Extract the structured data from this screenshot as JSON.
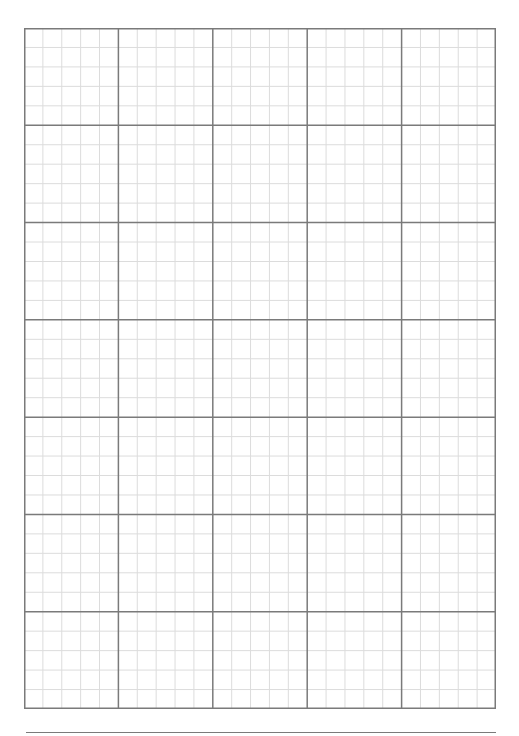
{
  "page": {
    "type": "graph-paper",
    "background": "#ffffff"
  },
  "grid": {
    "left": 24,
    "top": 28,
    "width": 472,
    "height": 681,
    "major_columns": 5,
    "major_rows": 7,
    "minor_subdivisions": 5,
    "major_color": "#7a7a7a",
    "minor_color": "#dcdcdc",
    "major_width": 1.5,
    "minor_width": 1
  },
  "footer_line": {
    "left": 26,
    "top": 732,
    "width": 470,
    "color": "#7a7a7a"
  }
}
